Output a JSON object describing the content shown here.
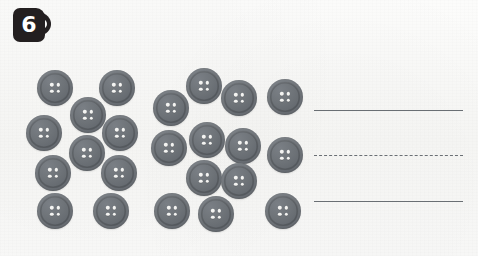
{
  "worksheet": {
    "title": "Count the buttons",
    "background_color": "#f9f9f8",
    "exercise": {
      "number_label": "6",
      "badge_color": "#231f20",
      "badge_text_color": "#ffffff"
    }
  },
  "objects": {
    "object_name": "button",
    "object_color": "#6e7378",
    "hole_color": "#f4f4f2",
    "holes_per_object": 4,
    "total_count": 23,
    "groups": [
      {
        "group_name": "left-cluster",
        "count": 10,
        "items": [
          {
            "label": "button-1",
            "x": 55,
            "y": 88,
            "size": 36
          },
          {
            "label": "button-2",
            "x": 117,
            "y": 88,
            "size": 36
          },
          {
            "label": "button-3",
            "x": 88,
            "y": 115,
            "size": 36
          },
          {
            "label": "button-4",
            "x": 44,
            "y": 133,
            "size": 36
          },
          {
            "label": "button-5",
            "x": 120,
            "y": 133,
            "size": 36
          },
          {
            "label": "button-6",
            "x": 87,
            "y": 153,
            "size": 36
          },
          {
            "label": "button-7",
            "x": 53,
            "y": 173,
            "size": 36
          },
          {
            "label": "button-8",
            "x": 119,
            "y": 173,
            "size": 36
          },
          {
            "label": "button-9",
            "x": 55,
            "y": 211,
            "size": 36
          },
          {
            "label": "button-10",
            "x": 111,
            "y": 211,
            "size": 36
          }
        ]
      },
      {
        "group_name": "right-cluster",
        "count": 13,
        "items": [
          {
            "label": "button-11",
            "x": 204,
            "y": 86,
            "size": 36
          },
          {
            "label": "button-12",
            "x": 171,
            "y": 108,
            "size": 36
          },
          {
            "label": "button-13",
            "x": 239,
            "y": 98,
            "size": 36
          },
          {
            "label": "button-14",
            "x": 285,
            "y": 97,
            "size": 36
          },
          {
            "label": "button-15",
            "x": 169,
            "y": 148,
            "size": 36
          },
          {
            "label": "button-16",
            "x": 207,
            "y": 140,
            "size": 36
          },
          {
            "label": "button-17",
            "x": 243,
            "y": 146,
            "size": 36
          },
          {
            "label": "button-18",
            "x": 285,
            "y": 155,
            "size": 36
          },
          {
            "label": "button-19",
            "x": 204,
            "y": 178,
            "size": 36
          },
          {
            "label": "button-20",
            "x": 239,
            "y": 181,
            "size": 36
          },
          {
            "label": "button-21",
            "x": 172,
            "y": 211,
            "size": 36
          },
          {
            "label": "button-22",
            "x": 216,
            "y": 214,
            "size": 36
          },
          {
            "label": "button-23",
            "x": 283,
            "y": 211,
            "size": 36
          }
        ]
      }
    ]
  },
  "answer_area": {
    "line_color": "#6a6f74",
    "left": 314,
    "right": 463,
    "lines": [
      {
        "name": "top-solid-line",
        "style": "solid",
        "y": 110
      },
      {
        "name": "middle-dashed-line",
        "style": "dashed",
        "y": 155
      },
      {
        "name": "bottom-solid-line",
        "style": "solid",
        "y": 201
      }
    ]
  }
}
